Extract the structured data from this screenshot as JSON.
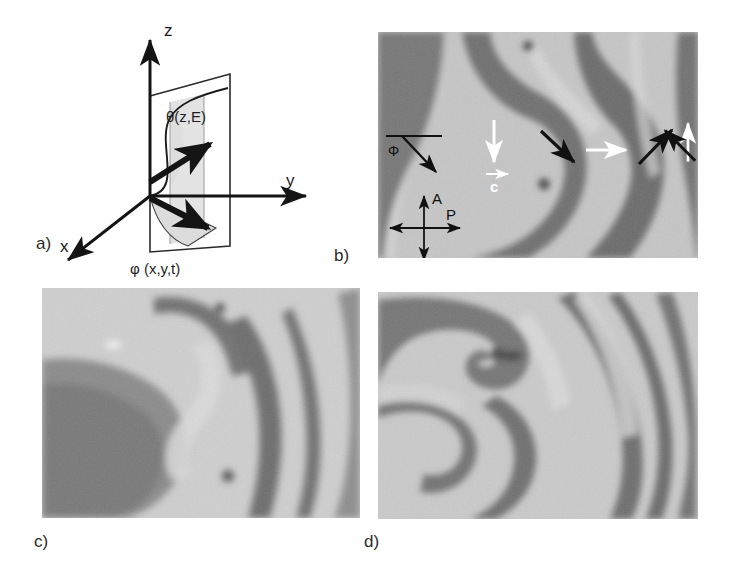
{
  "figure": {
    "type": "scientific-figure",
    "background_color": "#ffffff",
    "panel_count": 4
  },
  "panels": [
    {
      "id": "a",
      "label": "a)",
      "kind": "schematic",
      "title": "director field coordinate schematic",
      "axes": [
        {
          "name": "z-axis",
          "label": "z",
          "direction": "up"
        },
        {
          "name": "y-axis",
          "label": "y",
          "direction": "right"
        },
        {
          "name": "x-axis",
          "label": "x",
          "direction": "down-left"
        }
      ],
      "annotations": [
        {
          "name": "tilt-angle-label",
          "text": "θ(z,E)",
          "role": "tilt angle versus height and field"
        },
        {
          "name": "azimuth-angle-label",
          "text": "φ (x,y,t)",
          "role": "azimuthal angle versus position and time"
        }
      ],
      "shading": {
        "plane_fill": "#dcdcdc",
        "floor_fill": "#d8d8d8"
      }
    },
    {
      "id": "b",
      "label": "b)",
      "kind": "micrograph",
      "annotations": {
        "angle_indicator": {
          "name": "phi-angle-indicator",
          "label": "φ"
        },
        "crossed_polarizers": {
          "name": "polarizer-analyzer-cross",
          "analyzer_label": "A",
          "polarizer_label": "P",
          "analyzer_orientation": "vertical",
          "polarizer_orientation": "horizontal"
        },
        "velocity_vector": {
          "name": "c-vector-label",
          "label": "c"
        },
        "arrows": [
          {
            "name": "arrow-white-down",
            "color": "#ffffff",
            "angle_deg": 90
          },
          {
            "name": "arrow-black-down-right",
            "color": "#111111",
            "angle_deg": 45
          },
          {
            "name": "arrow-white-right",
            "color": "#ffffff",
            "angle_deg": 0
          },
          {
            "name": "arrow-black-up-right",
            "color": "#111111",
            "angle_deg": -45
          },
          {
            "name": "arrow-white-up",
            "color": "#ffffff",
            "angle_deg": -90
          },
          {
            "name": "arrow-black-up-left",
            "color": "#111111",
            "angle_deg": -135
          }
        ]
      }
    },
    {
      "id": "c",
      "label": "c)",
      "kind": "micrograph",
      "annotations": {}
    },
    {
      "id": "d",
      "label": "d)",
      "kind": "micrograph",
      "annotations": {}
    }
  ],
  "colors": {
    "ink": "#1a1a1a",
    "white_arrow": "#ffffff",
    "black_arrow": "#111111",
    "page_background": "#ffffff",
    "micrograph_light": "#d2d2d2",
    "micrograph_dark": "#5a5a5a"
  }
}
